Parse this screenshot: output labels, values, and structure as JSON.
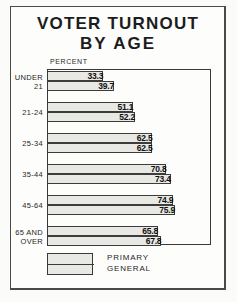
{
  "figure": {
    "title_line_1": "VOTER TURNOUT",
    "title_line_2": "BY AGE",
    "axis_caption": "PERCENT",
    "legend": {
      "primary_label": "PRIMARY",
      "general_label": "GENERAL"
    },
    "colors": {
      "bar_fill": "#e8e8e4",
      "bar_outline": "#3c3c3c",
      "frame": "#3a3a3a",
      "page": "#fdfdfb",
      "text": "#1c1c1c"
    }
  },
  "chart_data": {
    "type": "bar",
    "orientation": "horizontal",
    "title": "VOTER TURNOUT BY AGE",
    "xlabel": "PERCENT",
    "ylabel": "",
    "xlim": [
      0,
      100
    ],
    "grid": false,
    "legend_position": "bottom-left",
    "categories": [
      "UNDER\n21",
      "21-24",
      "25-34",
      "35-44",
      "45-64",
      "65 AND\nOVER"
    ],
    "series": [
      {
        "name": "PRIMARY",
        "values": [
          33.3,
          51.1,
          62.5,
          70.8,
          74.9,
          65.8
        ],
        "labels": [
          "33.3",
          "51.1",
          "62.5",
          "70.8",
          "74.9",
          "65.8"
        ]
      },
      {
        "name": "GENERAL",
        "values": [
          39.7,
          52.2,
          62.5,
          73.4,
          75.9,
          67.8
        ],
        "labels": [
          "39.7",
          "52.2",
          "62.5",
          "73.4",
          "75.9",
          "67.8"
        ]
      }
    ]
  }
}
